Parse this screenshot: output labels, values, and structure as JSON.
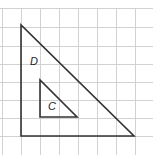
{
  "diagram": {
    "grid": {
      "spacing": 19,
      "origin_x": 2,
      "origin_y": 8,
      "color": "#cfcfcf"
    },
    "shapes": [
      {
        "label": "D",
        "type": "right-triangle",
        "points": [
          [
            21,
            25
          ],
          [
            21,
            136
          ],
          [
            134,
            136
          ]
        ]
      },
      {
        "label": "C",
        "type": "right-triangle",
        "points": [
          [
            40,
            80
          ],
          [
            40,
            117
          ],
          [
            77,
            117
          ]
        ]
      }
    ],
    "top_partial_text": "g"
  }
}
